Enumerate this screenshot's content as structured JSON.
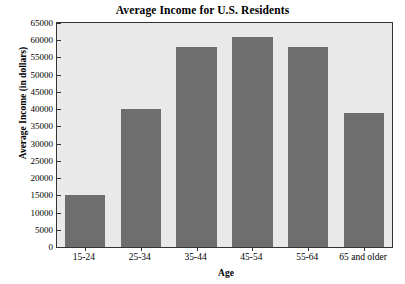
{
  "chart_data": {
    "type": "bar",
    "title": "Average Income for U.S. Residents",
    "xlabel": "Age",
    "ylabel": "Average Income (in dollars)",
    "categories": [
      "15-24",
      "25-34",
      "35-44",
      "45-54",
      "55-64",
      "65 and older"
    ],
    "values": [
      15000,
      40000,
      58000,
      61000,
      58000,
      39000
    ],
    "ylim": [
      0,
      65000
    ],
    "ytick_values": [
      0,
      5000,
      10000,
      15000,
      20000,
      25000,
      30000,
      35000,
      40000,
      45000,
      50000,
      55000,
      60000,
      65000
    ],
    "ytick_labels": [
      "0",
      "5000",
      "10000",
      "15000",
      "20000",
      "25000",
      "30000",
      "35000",
      "40000",
      "45000",
      "50000",
      "55000",
      "60000",
      "65000"
    ],
    "grid": false,
    "legend": false,
    "bar_color": "#6e6e6e",
    "plot_background": "#e9e9e9",
    "axis_color": "#333333",
    "text_color": "#000000"
  }
}
